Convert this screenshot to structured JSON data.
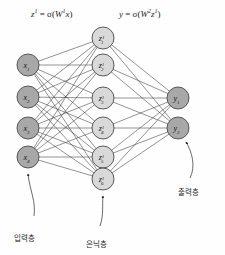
{
  "diagram": {
    "background": "#fefefe",
    "edge_color": "#3a3a3a",
    "formulas": {
      "hidden": {
        "lhs": "z",
        "lhs_sup": "1",
        "eq": "=",
        "act": "σ",
        "open": "(",
        "w": "W",
        "w_sup": "1",
        "arg": "x",
        "close": ")",
        "full": "z¹ = σ(W¹x)"
      },
      "output": {
        "lhs": "y",
        "eq": "=",
        "act": "σ",
        "open": "(",
        "w": "W",
        "w_sup": "2",
        "arg": "z",
        "arg_sup": "1",
        "close": ")",
        "full": "y = σ(W²z¹)"
      }
    },
    "layers": [
      {
        "id": "input",
        "label": "입력층",
        "fill": "#a8a8a8",
        "stroke": "#4a4a4a",
        "cx": 28,
        "r": 11,
        "nodes": [
          {
            "base": "x",
            "sub": "1",
            "sup": "",
            "cy": 65
          },
          {
            "base": "x",
            "sub": "2",
            "sup": "",
            "cy": 97
          },
          {
            "base": "x",
            "sub": "3",
            "sup": "",
            "cy": 128
          },
          {
            "base": "x",
            "sub": "4",
            "sup": "",
            "cy": 157
          }
        ]
      },
      {
        "id": "hidden",
        "label": "은닉층",
        "fill": "#d9d9d9",
        "stroke": "#4a4a4a",
        "cx": 103,
        "r": 11,
        "nodes": [
          {
            "base": "z",
            "sub": "1",
            "sup": "1",
            "cy": 38
          },
          {
            "base": "z",
            "sub": "2",
            "sup": "1",
            "cy": 65
          },
          {
            "base": "z",
            "sub": "3",
            "sup": "1",
            "cy": 98
          },
          {
            "base": "z",
            "sub": "4",
            "sup": "1",
            "cy": 128
          },
          {
            "base": "z",
            "sub": "5",
            "sup": "1",
            "cy": 157
          },
          {
            "base": "z",
            "sub": "6",
            "sup": "1",
            "cy": 179
          }
        ]
      },
      {
        "id": "output",
        "label": "출력층",
        "fill": "#a8a8a8",
        "stroke": "#4a4a4a",
        "cx": 178,
        "r": 11,
        "nodes": [
          {
            "base": "y",
            "sub": "1",
            "sup": "",
            "cy": 98
          },
          {
            "base": "y",
            "sub": "2",
            "sup": "",
            "cy": 128
          }
        ]
      }
    ],
    "annotations": [
      {
        "id": "input-annotation",
        "text": "입력층",
        "x": 14,
        "y": 232,
        "arrow_to_x": 28,
        "arrow_to_y": 172,
        "curve": "M 34 216 C 36 200 30 192 28 174"
      },
      {
        "id": "hidden-annotation",
        "text": "은닉층",
        "x": 86,
        "y": 238,
        "arrow_to_x": 103,
        "arrow_to_y": 194,
        "curve": "M 100 226 C 104 214 102 206 103 196"
      },
      {
        "id": "output-annotation",
        "text": "출력층",
        "x": 178,
        "y": 186,
        "arrow_to_x": 186,
        "arrow_to_y": 140,
        "curve": "M 190 178 C 196 166 192 152 186 142"
      }
    ]
  },
  "chart_data": {
    "type": "diagram",
    "architecture": {
      "input_units": 4,
      "hidden_units": 6,
      "output_units": 2,
      "fully_connected": true
    },
    "edges": {
      "input_to_hidden": 24,
      "hidden_to_output": 12,
      "total": 36
    },
    "equations": [
      "z¹ = σ(W¹x)",
      "y = σ(W²z¹)"
    ],
    "node_labels": {
      "input": [
        "x₁",
        "x₂",
        "x₃",
        "x₄"
      ],
      "hidden": [
        "z¹₁",
        "z¹₂",
        "z¹₃",
        "z¹₄",
        "z¹₅",
        "z¹₆"
      ],
      "output": [
        "y₁",
        "y₂"
      ]
    },
    "layer_names_ko": [
      "입력층",
      "은닉층",
      "출력층"
    ],
    "layer_names_en": [
      "input layer",
      "hidden layer",
      "output layer"
    ]
  }
}
